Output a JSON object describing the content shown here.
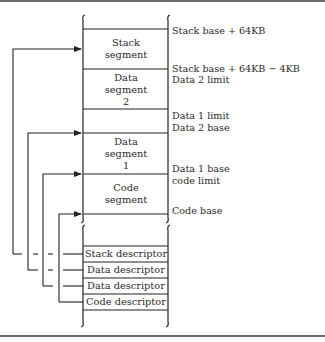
{
  "diagram": {
    "type": "segmented-memory-layout",
    "segments": [
      {
        "id": "stack",
        "lines": [
          "Stack",
          "segment"
        ]
      },
      {
        "id": "data2",
        "lines": [
          "Data",
          "segment",
          "2"
        ]
      },
      {
        "id": "data1",
        "lines": [
          "Data",
          "segment",
          "1"
        ]
      },
      {
        "id": "code",
        "lines": [
          "Code",
          "segment"
        ]
      }
    ],
    "address_labels": [
      "Stack base + 64KB",
      "Stack base + 64KB − 4KB",
      "Data 2 limit",
      "Data 1 limit",
      "Data 2 base",
      "Data 1 base",
      "code limit",
      "Code base"
    ],
    "descriptors": [
      "Stack descriptor",
      "Data descriptor",
      "Data descriptor",
      "Code descriptor"
    ],
    "connections": [
      {
        "from": "Stack descriptor",
        "to": "Stack segment base"
      },
      {
        "from": "Data descriptor (1st)",
        "to": "Data segment 2 base"
      },
      {
        "from": "Data descriptor (2nd)",
        "to": "Data segment 1 base"
      },
      {
        "from": "Code descriptor",
        "to": "Code segment base"
      }
    ],
    "colors": {
      "line": "#222222",
      "rule": "#6b6b6b",
      "background": "#ffffff"
    }
  }
}
